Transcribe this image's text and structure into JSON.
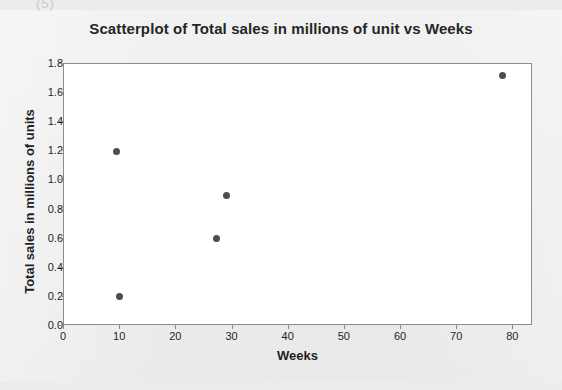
{
  "artifact": {
    "top_mark": "(5)"
  },
  "chart_data": {
    "type": "scatter",
    "title": "Scatterplot of Total sales in millions of unit vs Weeks",
    "xlabel": "Weeks",
    "ylabel": "Total sales in millions of units",
    "xlim": [
      0,
      83.5
    ],
    "ylim": [
      0.0,
      1.8
    ],
    "grid": false,
    "legend": null,
    "marker_color": "#4d4d4d",
    "plot_background": "#ffffff",
    "frame_color": "#8c8c8c",
    "xticks": [
      0,
      10,
      20,
      30,
      40,
      50,
      60,
      70,
      80
    ],
    "xtick_labels": [
      "0",
      "10",
      "20",
      "30",
      "40",
      "50",
      "60",
      "70",
      "80"
    ],
    "yticks": [
      0.0,
      0.2,
      0.4,
      0.6,
      0.8,
      1.0,
      1.2,
      1.4,
      1.6,
      1.8
    ],
    "ytick_labels": [
      "0.0",
      "0.2",
      "0.4",
      "0.6",
      "0.8",
      "1.0",
      "1.2",
      "1.4",
      "1.6",
      "1.8"
    ],
    "points": [
      {
        "x": 9.3,
        "y": 1.2
      },
      {
        "x": 9.8,
        "y": 0.2
      },
      {
        "x": 27.1,
        "y": 0.6
      },
      {
        "x": 28.9,
        "y": 0.9
      },
      {
        "x": 78.0,
        "y": 1.72
      }
    ]
  }
}
